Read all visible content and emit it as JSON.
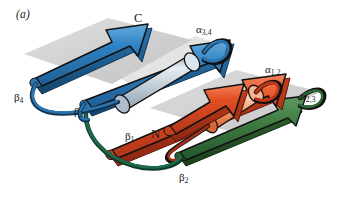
{
  "figure": {
    "panel_id": "(a)",
    "type": "protein-topology-ribbon-diagram",
    "background_color": "#ffffff"
  },
  "termini": [
    {
      "name": "c-terminus",
      "label": "C",
      "x": 134,
      "y": 12
    },
    {
      "name": "n-terminus",
      "label": "N",
      "x": 151,
      "y": 128
    }
  ],
  "strand_labels": [
    {
      "name": "beta-4",
      "base": "β",
      "sub": "4",
      "x": 14,
      "y": 92,
      "color": "#1a1a1a"
    },
    {
      "name": "beta-3",
      "base": "β",
      "sub": "3",
      "x": 74,
      "y": 106,
      "color": "#1a1a1a"
    },
    {
      "name": "beta-1",
      "base": "β",
      "sub": "1",
      "x": 125,
      "y": 131,
      "color": "#1a1a1a"
    },
    {
      "name": "beta-2",
      "base": "β",
      "sub": "2",
      "x": 179,
      "y": 172,
      "color": "#1a1a1a"
    }
  ],
  "helix_labels": [
    {
      "name": "alpha-3-4",
      "base": "α",
      "sub": "3,4",
      "x": 196,
      "y": 24,
      "color": "#1a1a1a"
    },
    {
      "name": "alpha-1-2",
      "base": "α",
      "sub": "1,2",
      "x": 265,
      "y": 64,
      "color": "#1a1a1a"
    },
    {
      "name": "alpha-2-3",
      "base": "α",
      "sub": "2,3",
      "x": 300,
      "y": 91,
      "color": "#1a1a1a"
    }
  ],
  "colors": {
    "blue_strand": "#2f82c4",
    "blue_strand_dark": "#1f5f96",
    "blue_strand_light": "#62a8da",
    "blue_loop": "#1f5f96",
    "red_strand": "#e0481f",
    "red_strand_dark": "#a8311a",
    "red_strand_light": "#f07a4d",
    "red_loop": "#9e2b18",
    "green_strand": "#2f6b35",
    "green_strand_light": "#4f8a50",
    "green_loop": "#1d6b4e",
    "helix_blue_gray": "#b9c6d2",
    "helix_orange": "#f08a5a",
    "sheet_plane": "#cfcfcf",
    "outline": "#111111",
    "text": "#1a1a1a"
  },
  "elements": [
    {
      "name": "beta-sheet-plane-left",
      "kind": "plane",
      "color": "#d2d2d2"
    },
    {
      "name": "beta-sheet-plane-right",
      "kind": "plane",
      "color": "#d2d2d2"
    },
    {
      "name": "beta-strand-arrow-4",
      "kind": "arrow",
      "color": "#2f82c4"
    },
    {
      "name": "beta-strand-arrow-3",
      "kind": "arrow",
      "color": "#2f82c4"
    },
    {
      "name": "alpha-helix-cylinder-3-4",
      "kind": "cylinder",
      "color": "#b9c6d2"
    },
    {
      "name": "alpha-helix-cylinder-1-2",
      "kind": "cylinder",
      "color": "#f08a5a"
    },
    {
      "name": "beta-strand-arrow-1",
      "kind": "arrow",
      "color": "#e0481f"
    },
    {
      "name": "beta-strand-arrow-3-red",
      "kind": "arrow",
      "color": "#e0481f"
    },
    {
      "name": "beta-strand-arrow-2-green",
      "kind": "arrow",
      "color": "#2f6b35"
    },
    {
      "name": "loop-alpha-3-4",
      "kind": "loop",
      "color": "#1f5f96"
    },
    {
      "name": "loop-alpha-1-2",
      "kind": "loop",
      "color": "#9e2b18"
    },
    {
      "name": "loop-alpha-2-3",
      "kind": "loop",
      "color": "#2f6b35"
    },
    {
      "name": "loop-beta-1-green",
      "kind": "loop",
      "color": "#1d6b4e"
    },
    {
      "name": "loop-beta-4-blue",
      "kind": "loop",
      "color": "#1f5f96"
    }
  ]
}
